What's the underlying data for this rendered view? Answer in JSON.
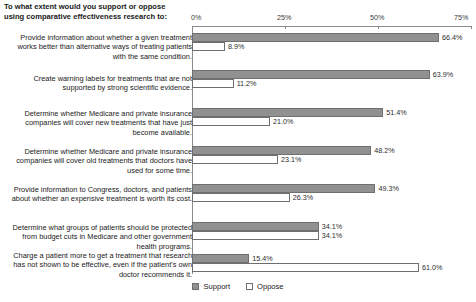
{
  "title": "To what extent would you support or oppose using comparative effectiveness research to:",
  "legend": {
    "support_label": "Support",
    "oppose_label": "Oppose"
  },
  "axis": {
    "ticks": [
      "0%",
      "25%",
      "50%",
      "75%"
    ],
    "tick_values": [
      0,
      25,
      50,
      75
    ]
  },
  "colors": {
    "support": "#919191",
    "oppose": "#ffffff",
    "outline": "#6f6f6f",
    "axis": "#8a8a8a",
    "text": "#1a1a1a"
  },
  "chart_data": {
    "type": "bar",
    "title": "To what extent would you support or oppose using comparative effectiveness research to:",
    "xlabel": "",
    "ylabel": "",
    "xlim": [
      0,
      75
    ],
    "grid": false,
    "legend_position": "bottom",
    "orientation": "horizontal",
    "categories": [
      "Provide information about whether a given treatment works better than alternative ways of treating patients with the same condition.",
      "Create warning labels for treatments that are not supported by strong scientific evidence.",
      "Determine whether Medicare and private insurance companies will cover new treatments that have just become available.",
      "Determine whether Medicare and private insurance companies will cover old treatments that doctors have used for some time.",
      "Provide information to Congress, doctors, and patients about whether an expensive treatment is worth its cost.",
      "Determine what groups of patients should be protected from budget cuts in Medicare and other government health programs.",
      "Charge a patient more to get a treatment that research has not shown to be effective, even if the patient's own doctor recommends it."
    ],
    "series": [
      {
        "name": "Support",
        "values": [
          66.4,
          63.9,
          51.4,
          48.2,
          49.3,
          34.1,
          15.4
        ],
        "labels": [
          "66.4%",
          "63.9%",
          "51.4%",
          "48.2%",
          "49.3%",
          "34.1%",
          "15.4%"
        ]
      },
      {
        "name": "Oppose",
        "values": [
          8.9,
          11.2,
          21.0,
          23.1,
          26.3,
          34.1,
          61.0
        ],
        "labels": [
          "8.9%",
          "11.2%",
          "21.0%",
          "23.1%",
          "26.3%",
          "34.1%",
          "61.0%"
        ]
      }
    ]
  }
}
